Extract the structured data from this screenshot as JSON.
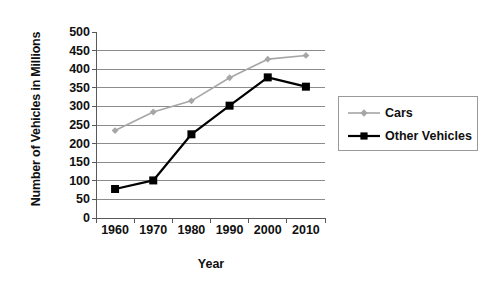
{
  "chart_data": {
    "type": "line",
    "title": "",
    "xlabel": "Year",
    "ylabel": "Number of Vehicles in Millions",
    "categories": [
      "1960",
      "1970",
      "1980",
      "1990",
      "2000",
      "2010"
    ],
    "x": [
      1960,
      1970,
      1980,
      1990,
      2000,
      2010
    ],
    "ylim": [
      0,
      500
    ],
    "yticks": [
      0,
      50,
      100,
      150,
      200,
      250,
      300,
      350,
      400,
      450,
      500
    ],
    "ytick_labels": [
      "0",
      "50",
      "100",
      "150",
      "200",
      "250",
      "300",
      "350",
      "400",
      "450",
      "500"
    ],
    "grid": "horizontal",
    "legend_position": "right",
    "series": [
      {
        "name": "Cars",
        "color": "#a6a6a6",
        "marker": "diamond",
        "values": [
          235,
          285,
          315,
          377,
          427,
          437
        ]
      },
      {
        "name": "Other Vehicles",
        "color": "#000000",
        "marker": "square",
        "values": [
          78,
          101,
          225,
          302,
          378,
          353
        ]
      }
    ]
  },
  "legend": {
    "entries": [
      {
        "label": "Cars"
      },
      {
        "label": "Other Vehicles"
      }
    ]
  },
  "colors": {
    "cars": "#a6a6a6",
    "other_vehicles": "#000000",
    "gridline": "#8c8c8c",
    "axis": "#595959",
    "text": "#101010",
    "background": "#ffffff"
  }
}
